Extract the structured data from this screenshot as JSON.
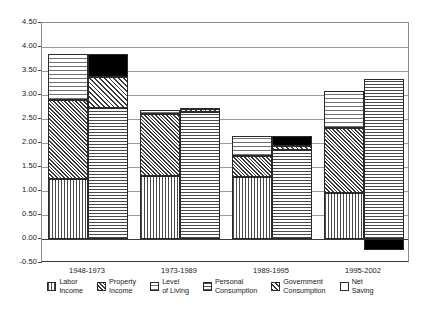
{
  "chart_data": {
    "type": "bar",
    "title": "",
    "subtitle": "",
    "xlabel": "",
    "ylabel": "",
    "grid": true,
    "legend_position": "bottom",
    "stacked": true,
    "grouped_pairs": true,
    "ylim": [
      -0.5,
      4.5
    ],
    "ytick_step": 0.5,
    "ytick_labels": [
      "4.50",
      "4.00",
      "3.50",
      "3.00",
      "2.50",
      "2.00",
      "1.50",
      "1.00",
      "0.50",
      "0.00",
      "-0.50"
    ],
    "ytick_values": [
      4.5,
      4.0,
      3.5,
      3.0,
      2.5,
      2.0,
      1.5,
      1.0,
      0.5,
      0.0,
      -0.5
    ],
    "categories": [
      "1948-1973",
      "1973-1989",
      "1989-1995",
      "1995-2002"
    ],
    "series": [
      {
        "name": "Labor Income",
        "pattern": "labor",
        "bar": "left",
        "values": [
          1.25,
          1.31,
          1.3,
          0.95
        ]
      },
      {
        "name": "Property Income",
        "pattern": "property",
        "bar": "left",
        "values": [
          1.65,
          1.29,
          0.42,
          1.37
        ]
      },
      {
        "name": "Level of Living",
        "pattern": "living",
        "bar": "left",
        "values": [
          0.95,
          0.08,
          0.43,
          0.76
        ]
      },
      {
        "name": "Personal Consumption",
        "pattern": "personal",
        "bar": "right",
        "values": [
          2.73,
          2.65,
          1.85,
          3.33
        ]
      },
      {
        "name": "Government Consumption",
        "pattern": "government",
        "bar": "right",
        "values": [
          0.65,
          0.05,
          0.08,
          0.0
        ]
      },
      {
        "name": "Net Saving",
        "pattern": "saving",
        "bar": "right",
        "values": [
          0.47,
          0.03,
          0.22,
          -0.23
        ]
      }
    ],
    "bar_totals": {
      "left": [
        3.85,
        2.68,
        2.15,
        3.08
      ],
      "right": [
        3.85,
        2.73,
        2.15,
        3.1
      ]
    },
    "legend": [
      {
        "label": "Labor\nIncome",
        "pattern": "labor"
      },
      {
        "label": "Property\nIncome",
        "pattern": "property"
      },
      {
        "label": "Level\nof Living",
        "pattern": "living"
      },
      {
        "label": "Personal\nConsumption",
        "pattern": "personal"
      },
      {
        "label": "Government\nConsumption",
        "pattern": "government"
      },
      {
        "label": "Net\nSaving",
        "pattern": "saving"
      }
    ],
    "colors": {
      "axis": "#3a3a3a",
      "grid": "#9a9a9a",
      "text": "#1a1a1a",
      "net_saving": "#000000",
      "background": "#ffffff"
    }
  }
}
